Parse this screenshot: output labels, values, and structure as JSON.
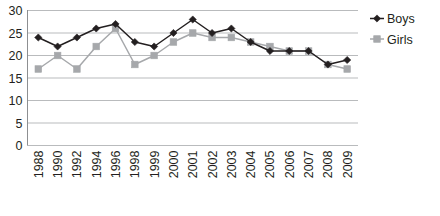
{
  "chart_data": {
    "type": "line",
    "title": "",
    "xlabel": "",
    "ylabel": "",
    "categories": [
      "1988",
      "1990",
      "1992",
      "1994",
      "1996",
      "1998",
      "1999",
      "2000",
      "2001",
      "2002",
      "2003",
      "2004",
      "2005",
      "2006",
      "2007",
      "2008",
      "2009"
    ],
    "series": [
      {
        "name": "Boys",
        "color": "#231f20",
        "marker": "diamond",
        "values": [
          24,
          22,
          24,
          26,
          27,
          23,
          22,
          25,
          28,
          25,
          26,
          23,
          21,
          21,
          21,
          18,
          19
        ]
      },
      {
        "name": "Girls",
        "color": "#a6a8ab",
        "marker": "square",
        "values": [
          17,
          20,
          17,
          22,
          26,
          18,
          20,
          23,
          25,
          24,
          24,
          23,
          22,
          21,
          21,
          18,
          17
        ]
      }
    ],
    "ylim": [
      0,
      30
    ],
    "yticks": [
      "0",
      "5",
      "10",
      "15",
      "20",
      "25",
      "30"
    ],
    "ytick_values": [
      0,
      5,
      10,
      15,
      20,
      25,
      30
    ],
    "grid": true,
    "legend_position": "right"
  },
  "legend": {
    "entries": [
      {
        "label": "Boys"
      },
      {
        "label": "Girls"
      }
    ]
  }
}
